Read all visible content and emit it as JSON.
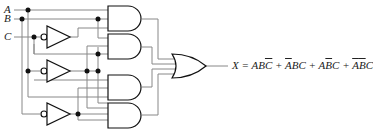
{
  "inputs": {
    "a": "A",
    "b": "B",
    "c": "C"
  },
  "output": {
    "lhs": "X",
    "eq": "=",
    "terms": [
      {
        "parts": [
          {
            "t": "A",
            "bar": false
          },
          {
            "t": "B",
            "bar": false
          },
          {
            "t": "C",
            "bar": true
          }
        ]
      },
      {
        "parts": [
          {
            "t": "A",
            "bar": true
          },
          {
            "t": "B",
            "bar": false
          },
          {
            "t": "C",
            "bar": false
          }
        ]
      },
      {
        "parts": [
          {
            "t": "A",
            "bar": false
          },
          {
            "t": "B",
            "bar": true
          },
          {
            "t": "C",
            "bar": false
          }
        ]
      },
      {
        "parts": [
          {
            "t": "A",
            "bar": true
          },
          {
            "t": "B",
            "bar": true
          },
          {
            "t": "C",
            "bar": false
          }
        ]
      }
    ],
    "plus": "+",
    "expression": "X = ABC̄ + ĀBC + AB̄C + ĀB̄C"
  },
  "gates": {
    "inverters": 3,
    "and_gates": 4,
    "or_gates": 1
  },
  "colors": {
    "wire": "#7a7a7a",
    "gate": "#111111",
    "text": "#222222"
  }
}
